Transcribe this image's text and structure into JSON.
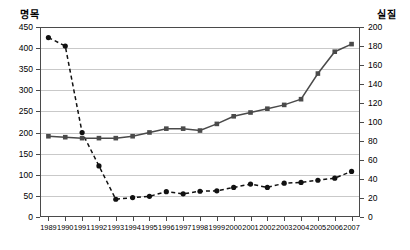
{
  "chart_data": {
    "type": "line",
    "title": "",
    "xlabel": "",
    "grid": true,
    "legend_position": "none",
    "categories": [
      "1989",
      "1990",
      "1991",
      "1992",
      "1993",
      "1994",
      "1995",
      "1996",
      "1997",
      "1998",
      "1999",
      "2000",
      "2001",
      "2002",
      "2003",
      "2004",
      "2005",
      "2006",
      "2007"
    ],
    "axes": {
      "left": {
        "label": "명목",
        "ticks": [
          0,
          50,
          100,
          150,
          200,
          250,
          300,
          350,
          400,
          450
        ],
        "ylim": [
          0,
          450
        ]
      },
      "right": {
        "label": "실질",
        "ticks": [
          0,
          20,
          40,
          60,
          80,
          100,
          120,
          140,
          160,
          180,
          200
        ],
        "ylim": [
          0,
          200
        ]
      }
    },
    "series": [
      {
        "name": "명목",
        "axis": "left",
        "style": "dashed",
        "marker": "circle",
        "color": "#111111",
        "values": [
          425,
          405,
          200,
          121,
          42,
          46,
          49,
          60,
          55,
          61,
          62,
          70,
          78,
          70,
          80,
          82,
          87,
          92,
          108
        ]
      },
      {
        "name": "실질",
        "axis": "right",
        "style": "solid",
        "marker": "square",
        "color": "#4a4a4a",
        "values": [
          85,
          84,
          83,
          83,
          83,
          85,
          89,
          93,
          93,
          91,
          98,
          106,
          110,
          114,
          118,
          124,
          151,
          174,
          182
        ]
      }
    ]
  }
}
